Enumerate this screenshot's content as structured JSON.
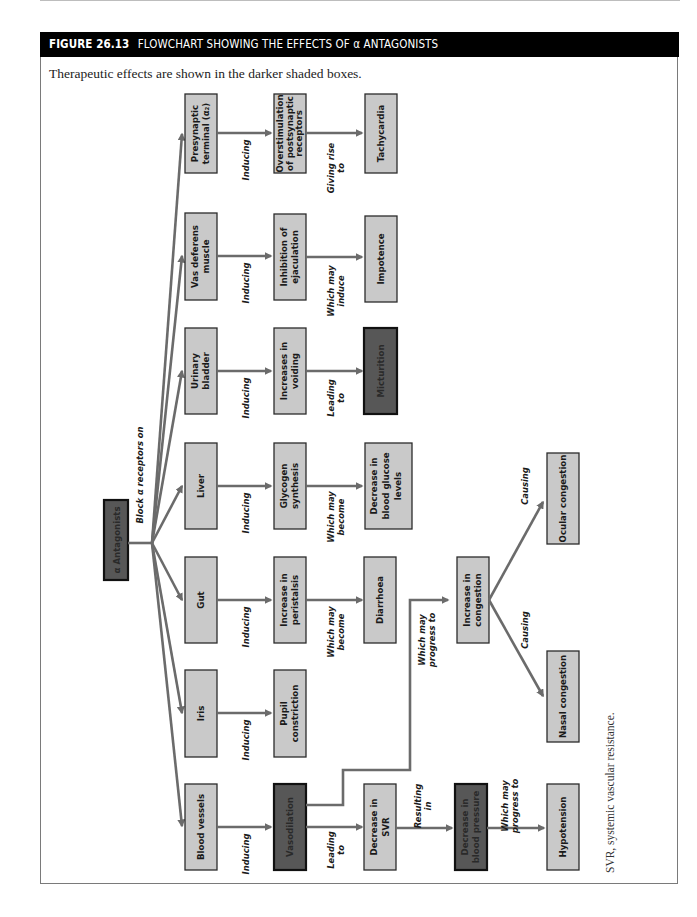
{
  "figure": {
    "number": "FIGURE 26.13",
    "title": "FLOWCHART SHOWING THE EFFECTS OF α ANTAGONISTS",
    "caption": "Therapeutic effects are shown in the darker shaded boxes.",
    "footnote": "SVR, systemic vascular resistance.",
    "colors": {
      "header_bg": "#000000",
      "light_box": "#c9c9c9",
      "dark_box": "#575757",
      "arrow": "#6b6b6b"
    }
  },
  "root": {
    "label": "α Antagonists",
    "edge_label": "Block α  receptors on"
  },
  "branches": [
    {
      "target": "Presynaptic terminal (α2)",
      "target_lines": [
        "Presynaptic",
        "terminal (α₂)"
      ],
      "edge1": [
        "Inducing"
      ],
      "effect": "Overstimulation of postsynaptic receptors",
      "effect_lines": [
        "Overstimulation",
        "of postsynaptic",
        "receptors"
      ],
      "edge2": [
        "Giving rise",
        "to"
      ],
      "outcome": "Tachycardia",
      "outcome_lines": [
        "Tachycardia"
      ],
      "outcome_therapeutic": false
    },
    {
      "target": "Vas deferens muscle",
      "target_lines": [
        "Vas deferens",
        "muscle"
      ],
      "edge1": [
        "Inducing"
      ],
      "effect": "Inhibition of ejaculation",
      "effect_lines": [
        "Inhibition of",
        "ejaculation"
      ],
      "edge2": [
        "Which may",
        "induce"
      ],
      "outcome": "Impotence",
      "outcome_lines": [
        "Impotence"
      ],
      "outcome_therapeutic": false
    },
    {
      "target": "Urinary bladder",
      "target_lines": [
        "Urinary",
        "bladder"
      ],
      "edge1": [
        "Inducing"
      ],
      "effect": "Increases in voiding",
      "effect_lines": [
        "Increases in",
        "voiding"
      ],
      "edge2": [
        "Leading",
        "to"
      ],
      "outcome": "Micturition",
      "outcome_lines": [
        "Micturition"
      ],
      "outcome_therapeutic": true
    },
    {
      "target": "Liver",
      "target_lines": [
        "Liver"
      ],
      "edge1": [
        "Inducing"
      ],
      "effect": "Glycogen synthesis",
      "effect_lines": [
        "Glycogen",
        "synthesis"
      ],
      "edge2": [
        "Which may",
        "become"
      ],
      "outcome": "Decrease in blood glucose levels",
      "outcome_lines": [
        "Decrease in",
        "blood glucose",
        "levels"
      ],
      "outcome_therapeutic": false
    },
    {
      "target": "Gut",
      "target_lines": [
        "Gut"
      ],
      "edge1": [
        "Inducing"
      ],
      "effect": "Increase in peristalsis",
      "effect_lines": [
        "Increase in",
        "peristalsis"
      ],
      "edge2": [
        "Which may",
        "become"
      ],
      "outcome": "Diarrhoea",
      "outcome_lines": [
        "Diarrhoea"
      ],
      "outcome_therapeutic": false
    },
    {
      "target": "Iris",
      "target_lines": [
        "Iris"
      ],
      "edge1": [
        "Inducing"
      ],
      "effect": "Pupil constriction",
      "effect_lines": [
        "Pupil",
        "constriction"
      ],
      "edge2": null,
      "outcome": null,
      "outcome_lines": null,
      "outcome_therapeutic": false
    },
    {
      "target": "Blood vessels",
      "target_lines": [
        "Blood vessels"
      ],
      "edge1": [
        "Inducing"
      ],
      "effect": "Vasodilation",
      "effect_lines": [
        "Vasodilation"
      ],
      "effect_therapeutic": true,
      "edge2": [
        "Leading",
        "to"
      ],
      "outcome": "Decrease in SVR",
      "outcome_lines": [
        "Decrease in",
        "SVR"
      ],
      "outcome_therapeutic": false
    }
  ],
  "vascular_chain": {
    "svr_edge": [
      "Resulting",
      "in"
    ],
    "bp": "Decrease in blood pressure",
    "bp_lines": [
      "Decrease in",
      "blood pressure"
    ],
    "bp_therapeutic": true,
    "bp_edge": [
      "Which may",
      "progress to"
    ],
    "hypotension": "Hypotension",
    "hypotension_lines": [
      "Hypotension"
    ]
  },
  "congestion_chain": {
    "vaso_edge": [
      "Which may",
      "progress to"
    ],
    "congestion": "Increase in congestion",
    "congestion_lines": [
      "Increase in",
      "congestion"
    ],
    "ocular_edge": [
      "Causing"
    ],
    "ocular": "Ocular congestion",
    "ocular_lines": [
      "Ocular congestion"
    ],
    "nasal_edge": [
      "Causing"
    ],
    "nasal": "Nasal congestion",
    "nasal_lines": [
      "Nasal congestion"
    ]
  }
}
